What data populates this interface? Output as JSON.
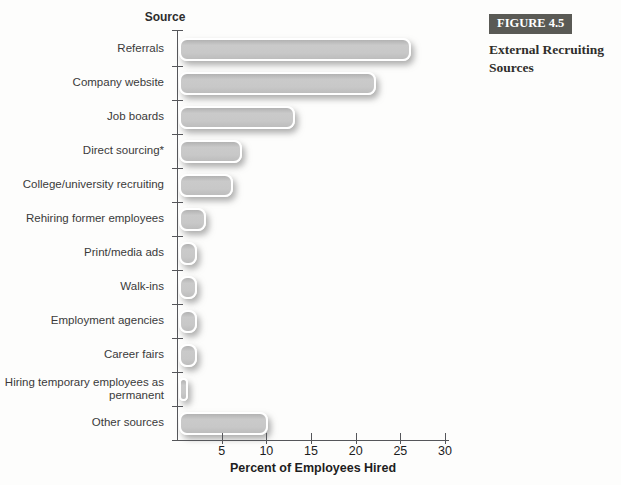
{
  "figure": {
    "label": "FIGURE 4.5",
    "caption": "External Recruiting Sources"
  },
  "chart_data": {
    "type": "bar",
    "orientation": "horizontal",
    "title": "External Recruiting Sources",
    "ylabel": "Source",
    "xlabel": "Percent of Employees Hired",
    "xlim": [
      0,
      30
    ],
    "xticks": [
      5,
      10,
      15,
      20,
      25,
      30
    ],
    "grid": false,
    "legend": "none",
    "categories": [
      "Referrals",
      "Company website",
      "Job boards",
      "Direct sourcing*",
      "College/university recruiting",
      "Rehiring former employees",
      "Print/media ads",
      "Walk-ins",
      "Employment agencies",
      "Career fairs",
      "Hiring temporary employees as permanent",
      "Other sources"
    ],
    "values": [
      26,
      22,
      13,
      7,
      6,
      3,
      2,
      2,
      2,
      2,
      1,
      10
    ]
  },
  "colors": {
    "bar_fill": "#c8c8c8",
    "bar_outline": "#ffffff",
    "axis": "#55565a",
    "label_text": "#3a3a3a",
    "figure_box_bg": "#5a5a55",
    "figure_box_text": "#ffffff"
  }
}
